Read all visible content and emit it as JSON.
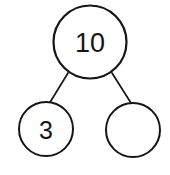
{
  "diagram": {
    "kind": "number-bond",
    "background_color": "#ffffff",
    "stroke_color": "#161616",
    "text_color": "#161616",
    "whole": {
      "label": "10",
      "cx": 90,
      "cy": 42,
      "r": 36.5,
      "stroke_width": 2.2,
      "filled": true
    },
    "parts": [
      {
        "name": "left-part",
        "label": "3",
        "cx": 46,
        "cy": 129,
        "r": 27,
        "stroke_width": 2.0,
        "filled": true
      },
      {
        "name": "right-part",
        "label": "",
        "cx": 133,
        "cy": 130,
        "r": 27,
        "stroke_width": 2.0,
        "filled": false
      }
    ],
    "connectors": [
      {
        "name": "connector-left",
        "x1": 68,
        "y1": 73,
        "x2": 49,
        "y2": 104,
        "stroke_width": 1.7
      },
      {
        "name": "connector-right",
        "x1": 112,
        "y1": 73,
        "x2": 131,
        "y2": 103,
        "stroke_width": 1.7
      }
    ]
  }
}
